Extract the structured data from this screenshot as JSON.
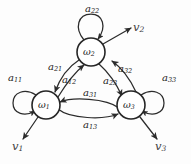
{
  "figure": {
    "type": "state-transition-diagram",
    "background_color": "#fdfdfd",
    "ink_color": "#2b2b2b",
    "nodes": [
      {
        "id": "w1",
        "label_base": "ω",
        "label_sub": "1",
        "cx": 46,
        "cy": 105,
        "r": 14
      },
      {
        "id": "w2",
        "label_base": "ω",
        "label_sub": "2",
        "cx": 91,
        "cy": 52,
        "r": 14
      },
      {
        "id": "w3",
        "label_base": "ω",
        "label_sub": "3",
        "cx": 131,
        "cy": 105,
        "r": 14
      }
    ],
    "transitions": [
      {
        "id": "a11",
        "base": "a",
        "sub": "11",
        "from": "w1",
        "to": "w1",
        "kind": "self-loop"
      },
      {
        "id": "a22",
        "base": "a",
        "sub": "22",
        "from": "w2",
        "to": "w2",
        "kind": "self-loop"
      },
      {
        "id": "a33",
        "base": "a",
        "sub": "33",
        "from": "w3",
        "to": "w3",
        "kind": "self-loop"
      },
      {
        "id": "a21",
        "base": "a",
        "sub": "21",
        "from": "w2",
        "to": "w1",
        "kind": "curved"
      },
      {
        "id": "a12",
        "base": "a",
        "sub": "12",
        "from": "w1",
        "to": "w2",
        "kind": "curved"
      },
      {
        "id": "a32",
        "base": "a",
        "sub": "32",
        "from": "w3",
        "to": "w2",
        "kind": "curved"
      },
      {
        "id": "a23",
        "base": "a",
        "sub": "23",
        "from": "w2",
        "to": "w3",
        "kind": "curved"
      },
      {
        "id": "a31",
        "base": "a",
        "sub": "31",
        "from": "w3",
        "to": "w1",
        "kind": "curved"
      },
      {
        "id": "a13",
        "base": "a",
        "sub": "13",
        "from": "w1",
        "to": "w3",
        "kind": "curved"
      }
    ],
    "outputs": [
      {
        "id": "v1",
        "base": "v",
        "sub": "1",
        "from": "w1",
        "direction": "down-left"
      },
      {
        "id": "v2",
        "base": "v",
        "sub": "2",
        "from": "w2",
        "direction": "up-right"
      },
      {
        "id": "v3",
        "base": "v",
        "sub": "3",
        "from": "w3",
        "direction": "down-right"
      }
    ],
    "labels": {
      "a11": {
        "base": "a",
        "sub": "11"
      },
      "a22": {
        "base": "a",
        "sub": "22"
      },
      "a33": {
        "base": "a",
        "sub": "33"
      },
      "a21": {
        "base": "a",
        "sub": "21"
      },
      "a12": {
        "base": "a",
        "sub": "12"
      },
      "a32": {
        "base": "a",
        "sub": "32"
      },
      "a23": {
        "base": "a",
        "sub": "23"
      },
      "a31": {
        "base": "a",
        "sub": "31"
      },
      "a13": {
        "base": "a",
        "sub": "13"
      },
      "w1": {
        "base": "ω",
        "sub": "1"
      },
      "w2": {
        "base": "ω",
        "sub": "2"
      },
      "w3": {
        "base": "ω",
        "sub": "3"
      },
      "v1": {
        "base": "v",
        "sub": "1"
      },
      "v2": {
        "base": "v",
        "sub": "2"
      },
      "v3": {
        "base": "v",
        "sub": "3"
      }
    }
  }
}
